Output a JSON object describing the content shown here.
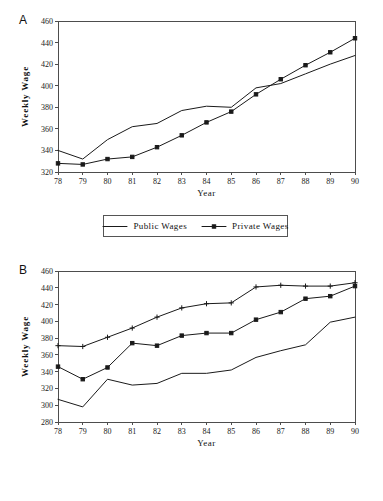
{
  "figure": {
    "panels": [
      {
        "id": "A",
        "letter": "A",
        "xlabel": "Year",
        "ylabel": "Weekly  Wage"
      },
      {
        "id": "B",
        "letter": "B",
        "xlabel": "Year",
        "ylabel": "Weekly  Wage"
      }
    ]
  },
  "chart_data": [
    {
      "type": "line",
      "panel": "A",
      "title": "",
      "xlabel": "Year",
      "ylabel": "Weekly  Wage",
      "x": [
        78,
        79,
        80,
        81,
        82,
        83,
        84,
        85,
        86,
        87,
        88,
        89,
        90
      ],
      "xticklabels": [
        "78",
        "79",
        "80",
        "81",
        "82",
        "83",
        "84",
        "85",
        "86",
        "87",
        "88",
        "89",
        "90"
      ],
      "yticks": [
        320,
        340,
        360,
        380,
        400,
        420,
        440,
        460
      ],
      "xlim": [
        78,
        90
      ],
      "ylim": [
        320,
        460
      ],
      "grid": false,
      "legend_position": "below",
      "series": [
        {
          "name": "Public Wages",
          "marker": "none",
          "values": [
            340,
            332,
            350,
            362,
            365,
            377,
            381,
            380,
            398,
            402,
            411,
            420,
            428
          ]
        },
        {
          "name": "Private Wages",
          "marker": "square",
          "values": [
            328,
            327,
            332,
            334,
            343,
            354,
            366,
            376,
            392,
            406,
            419,
            431,
            444
          ]
        }
      ]
    },
    {
      "type": "line",
      "panel": "B",
      "title": "",
      "xlabel": "Year",
      "ylabel": "Weekly  Wage",
      "x": [
        78,
        79,
        80,
        81,
        82,
        83,
        84,
        85,
        86,
        87,
        88,
        89,
        90
      ],
      "xticklabels": [
        "78",
        "79",
        "80",
        "81",
        "82",
        "83",
        "84",
        "85",
        "86",
        "87",
        "88",
        "89",
        "90"
      ],
      "yticks": [
        280,
        300,
        320,
        340,
        360,
        380,
        400,
        420,
        440,
        460
      ],
      "xlim": [
        78,
        90
      ],
      "ylim": [
        280,
        460
      ],
      "grid": false,
      "legend_position": "below",
      "series": [
        {
          "name": "Central Wages",
          "marker": "none",
          "values": [
            307,
            298,
            331,
            324,
            326,
            338,
            338,
            342,
            357,
            365,
            372,
            399,
            405
          ]
        },
        {
          "name": "Local Wages",
          "marker": "square",
          "values": [
            346,
            331,
            345,
            374,
            371,
            383,
            386,
            386,
            402,
            411,
            427,
            430,
            442
          ]
        },
        {
          "name": "Public Ent'p Wages",
          "marker": "plus",
          "values": [
            371,
            370,
            381,
            392,
            405,
            416,
            421,
            422,
            441,
            443,
            442,
            442,
            446
          ]
        }
      ]
    }
  ]
}
